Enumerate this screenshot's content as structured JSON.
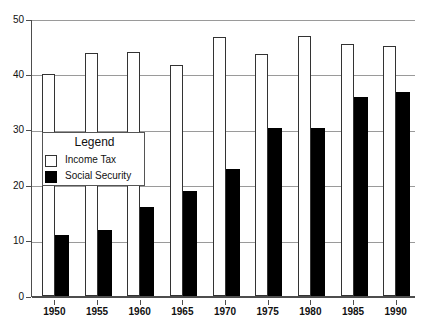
{
  "chart_data": {
    "type": "bar",
    "title": "",
    "subtitle": "",
    "xlabel": "",
    "ylabel": "",
    "categories": [
      "1950",
      "1955",
      "1960",
      "1965",
      "1970",
      "1975",
      "1980",
      "1985",
      "1990"
    ],
    "series": [
      {
        "name": "Income Tax",
        "color": "#ffffff",
        "edge_color": "#333333",
        "values": [
          40,
          43.8,
          44,
          41.7,
          46.7,
          43.7,
          47,
          45.4,
          45.1
        ]
      },
      {
        "name": "Social Security",
        "color": "#000000",
        "edge_color": "#000000",
        "values": [
          11,
          12,
          16,
          19,
          23,
          30.3,
          30.4,
          36,
          36.8
        ]
      }
    ],
    "ylim": [
      0,
      50
    ],
    "yticks": [
      0,
      10,
      20,
      30,
      40,
      50
    ],
    "ytick_labels": [
      "0",
      "10",
      "20",
      "30",
      "40",
      "50"
    ],
    "grid": true,
    "grid_axis": "y",
    "grid_color": "#9a9a9a",
    "axis_color": "#4d4d4d",
    "legend_position": "inside-left",
    "legend": {
      "title": "Legend",
      "entries": [
        {
          "label": "Income Tax",
          "swatch": "open-square-swatch"
        },
        {
          "label": "Social Security",
          "swatch": "filled-square-swatch"
        }
      ]
    }
  }
}
